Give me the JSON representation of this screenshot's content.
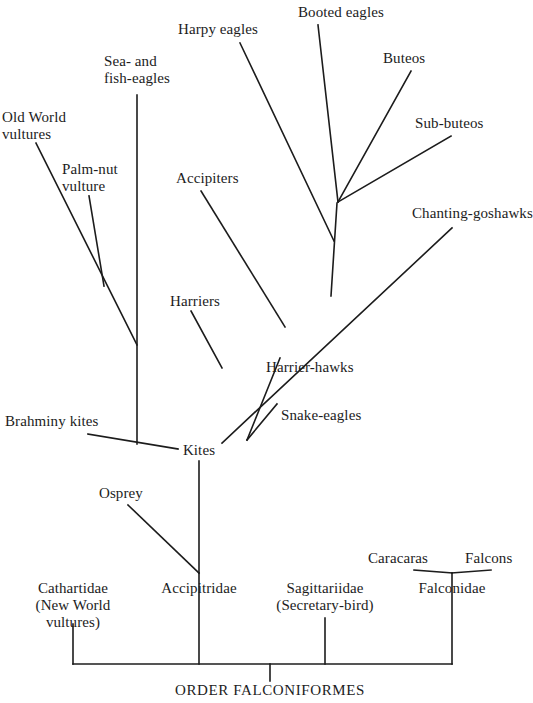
{
  "figure": {
    "title": "ORDER FALCONIFORMES",
    "kind": "phylogenetic-cladogram",
    "background_color": "#ffffff",
    "line_color": "#1c1c1c",
    "text_color": "#1c1c1c"
  },
  "root": {
    "label": "ORDER FALCONIFORMES",
    "x": 270,
    "y": 690
  },
  "families": [
    {
      "id": "cathartidae",
      "lines": [
        "Cathartidae",
        "(New World",
        "vultures)"
      ],
      "label": "Cathartidae (New World vultures)",
      "x": 73,
      "y": 588
    },
    {
      "id": "accipitridae",
      "lines": [
        "Accipitridae"
      ],
      "label": "Accipitridae",
      "x": 199,
      "y": 588
    },
    {
      "id": "sagittariidae",
      "lines": [
        "Sagittariidae",
        "(Secretary-bird)"
      ],
      "label": "Sagittariidae (Secretary-bird)",
      "x": 325,
      "y": 588
    },
    {
      "id": "falconidae",
      "lines": [
        "Falconidae"
      ],
      "label": "Falconidae",
      "x": 452,
      "y": 588
    }
  ],
  "nodes": [
    {
      "id": "kites",
      "label": "Kites",
      "x": 199,
      "y": 450
    }
  ],
  "tips": [
    {
      "id": "old-world-vultures",
      "lines": [
        "Old World",
        "vultures"
      ],
      "label": "Old World vultures",
      "x": 2,
      "y": 126,
      "anchor": "start"
    },
    {
      "id": "palm-nut-vulture",
      "lines": [
        "Palm-nut",
        "vulture"
      ],
      "label": "Palm-nut vulture",
      "x": 62,
      "y": 178,
      "anchor": "start"
    },
    {
      "id": "sea-fish-eagles",
      "lines": [
        "Sea- and",
        "fish-eagles"
      ],
      "label": "Sea- and fish-eagles",
      "x": 137,
      "y": 70,
      "anchor": "mid"
    },
    {
      "id": "harpy-eagles",
      "lines": [
        "Harpy eagles"
      ],
      "label": "Harpy eagles",
      "x": 178,
      "y": 29,
      "anchor": "start"
    },
    {
      "id": "booted-eagles",
      "lines": [
        "Booted eagles"
      ],
      "label": "Booted eagles",
      "x": 298,
      "y": 12,
      "anchor": "start"
    },
    {
      "id": "buteos",
      "lines": [
        "Buteos"
      ],
      "label": "Buteos",
      "x": 383,
      "y": 58,
      "anchor": "start"
    },
    {
      "id": "sub-buteos",
      "lines": [
        "Sub-buteos"
      ],
      "label": "Sub-buteos",
      "x": 415,
      "y": 123,
      "anchor": "start"
    },
    {
      "id": "chanting-goshawks",
      "lines": [
        "Chanting-goshawks"
      ],
      "label": "Chanting-goshawks",
      "x": 412,
      "y": 213,
      "anchor": "start"
    },
    {
      "id": "accipiters",
      "lines": [
        "Accipiters"
      ],
      "label": "Accipiters",
      "x": 176,
      "y": 178,
      "anchor": "start"
    },
    {
      "id": "harriers",
      "lines": [
        "Harriers"
      ],
      "label": "Harriers",
      "x": 170,
      "y": 301,
      "anchor": "start"
    },
    {
      "id": "harrier-hawks",
      "lines": [
        "Harrier-hawks"
      ],
      "label": "Harrier-hawks",
      "x": 266,
      "y": 367,
      "anchor": "start"
    },
    {
      "id": "snake-eagles",
      "lines": [
        "Snake-eagles"
      ],
      "label": "Snake-eagles",
      "x": 281,
      "y": 415,
      "anchor": "start"
    },
    {
      "id": "brahminy-kites",
      "lines": [
        "Brahminy kites"
      ],
      "label": "Brahminy kites",
      "x": 5,
      "y": 421,
      "anchor": "start"
    },
    {
      "id": "osprey",
      "lines": [
        "Osprey"
      ],
      "label": "Osprey",
      "x": 99,
      "y": 493,
      "anchor": "start"
    },
    {
      "id": "caracaras",
      "lines": [
        "Caracaras"
      ],
      "label": "Caracaras",
      "x": 368,
      "y": 558,
      "anchor": "start"
    },
    {
      "id": "falcons",
      "lines": [
        "Falcons"
      ],
      "label": "Falcons",
      "x": 465,
      "y": 558,
      "anchor": "start"
    }
  ],
  "branches": [
    {
      "id": "base-bar",
      "from_label": "cathartidae",
      "to_label": "falconidae",
      "points": "73,664 452,664"
    },
    {
      "id": "root-stem",
      "from_label": "base-bar",
      "to_label": "ORDER FALCONIFORMES",
      "points": "270,664 270,681"
    },
    {
      "id": "cathartidae-stem",
      "from_label": "Cathartidae",
      "to_label": "base-bar",
      "points": "73,624 73,664"
    },
    {
      "id": "accipitridae-stem",
      "from_label": "Accipitridae",
      "to_label": "base-bar",
      "points": "199,573 199,664"
    },
    {
      "id": "sagittariidae-stem",
      "from_label": "Sagittariidae",
      "to_label": "base-bar",
      "points": "325,618 325,664"
    },
    {
      "id": "falconidae-stem",
      "from_label": "Falconidae",
      "to_label": "base-bar",
      "points": "452,573 452,664"
    },
    {
      "id": "osprey-branch",
      "from_label": "Osprey",
      "to_label": "Accipitridae",
      "points": "128,505 199,573"
    },
    {
      "id": "kites-stem",
      "from_label": "Kites",
      "to_label": "Accipitridae",
      "points": "199,461 199,573"
    },
    {
      "id": "brahminy-kites-branch",
      "from_label": "Brahminy kites",
      "to_label": "Kites",
      "points": "88,434 178,449"
    },
    {
      "id": "sea-fish-eagles-stem",
      "from_label": "Sea- and fish-eagles",
      "to_label": "Kites",
      "points": "137,95 137,444"
    },
    {
      "id": "old-world-vultures-branch",
      "from_label": "Old World vultures",
      "to_label": "Sea- and fish-eagles",
      "points": "36,143 137,345"
    },
    {
      "id": "palm-nut-vulture-branch",
      "from_label": "Palm-nut vulture",
      "to_label": "Old World vultures",
      "points": "89,196 104,286"
    },
    {
      "id": "main-diagonal",
      "from_label": "Kites",
      "to_label": "Chanting-goshawks",
      "points": "222,443 452,228"
    },
    {
      "id": "snake-eagles-branch",
      "from_label": "Snake-eagles",
      "to_label": "main-diagonal",
      "points": "277,404 247,440"
    },
    {
      "id": "harrier-hawks-branch",
      "from_label": "Harrier-hawks",
      "to_label": "main-diagonal",
      "points": "280,358 247,440"
    },
    {
      "id": "harriers-branch",
      "from_label": "Harriers",
      "to_label": "main-diagonal",
      "points": "191,311 222,368"
    },
    {
      "id": "accipiters-branch",
      "from_label": "Accipiters",
      "to_label": "main-diagonal",
      "points": "201,191 285,327"
    },
    {
      "id": "eagle-clade-stem",
      "from_label": "eagle-clade",
      "to_label": "main-diagonal",
      "points": "337,203 331,296"
    },
    {
      "id": "harpy-eagles-branch",
      "from_label": "Harpy eagles",
      "to_label": "eagle-clade",
      "points": "240,43 334,241"
    },
    {
      "id": "booted-eagles-branch",
      "from_label": "Booted eagles",
      "to_label": "eagle-clade",
      "points": "318,25 338,202"
    },
    {
      "id": "buteos-branch",
      "from_label": "Buteos",
      "to_label": "eagle-clade",
      "points": "411,71 338,202"
    },
    {
      "id": "sub-buteos-branch",
      "from_label": "Sub-buteos",
      "to_label": "eagle-clade",
      "points": "451,136 338,202"
    },
    {
      "id": "caracaras-branch",
      "from_label": "Caracaras",
      "to_label": "Falconidae",
      "points": "414,570 452,573"
    },
    {
      "id": "falcons-branch",
      "from_label": "Falcons",
      "to_label": "Falconidae",
      "points": "491,570 452,573"
    }
  ]
}
